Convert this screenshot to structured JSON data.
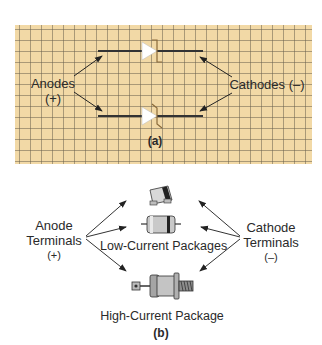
{
  "panel_a": {
    "caption": "(a)",
    "grid_color": "#f2d9a6",
    "left_label_line1": "Anodes",
    "left_label_line2": "(+)",
    "right_label": "Cathodes (–)",
    "symbols": [
      "zener-diode-symbol-top",
      "zener-diode-symbol-bottom"
    ]
  },
  "panel_b": {
    "caption": "(b)",
    "left_label_line1": "Anode",
    "left_label_line2": "Terminals",
    "left_label_line3": "(+)",
    "right_label_line1": "Cathode",
    "right_label_line2": "Terminals",
    "right_label_line3": "(–)",
    "low_current_label": "Low-Current Packages",
    "high_current_label": "High-Current Package"
  }
}
